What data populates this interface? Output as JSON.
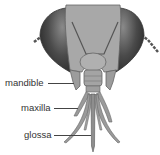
{
  "figure": {
    "labels": [
      {
        "id": "mandible",
        "text": "mandible"
      },
      {
        "id": "maxilla",
        "text": "maxilla"
      },
      {
        "id": "glossa",
        "text": "glossa"
      }
    ]
  },
  "colors": {
    "head": "#a6a6a6",
    "eye": "#4a4a4a",
    "mouthparts": "#9a9a9a",
    "outline": "#555555",
    "text": "#333333"
  }
}
